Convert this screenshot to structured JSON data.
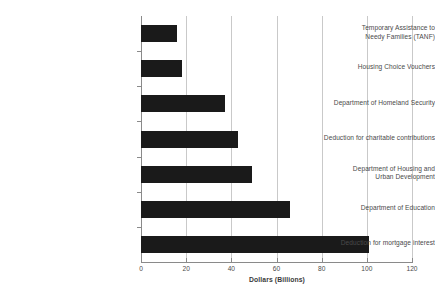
{
  "chart_data": {
    "type": "bar",
    "orientation": "horizontal",
    "title": "",
    "xlabel": "Dollars (Billions)",
    "ylabel": "",
    "xlim": [
      0,
      120
    ],
    "xticks": [
      0,
      20,
      40,
      60,
      80,
      100,
      120
    ],
    "xtick_labels": [
      "0",
      "20",
      "40",
      "60",
      "80",
      "100",
      "120"
    ],
    "grid": "vertical",
    "legend": "none",
    "bar_color": "#1a1a1a",
    "gridline_color": "#c9c9c9",
    "axis_color": "#8a8a8a",
    "label_color": "#4a4a4a",
    "categories": [
      "Temporary Assistance to Needy Families (TANF)",
      "Housing Choice Vouchers",
      "Department of Homeland Security",
      "Deduction for charitable contributions",
      "Department of Housing and Urban Development",
      "Department of Education",
      "Deduction for mortgage interest"
    ],
    "category_lines": [
      [
        "Temporary Assistance to",
        "Needy Families (TANF)"
      ],
      [
        "Housing Choice Vouchers"
      ],
      [
        "Department of Homeland Security"
      ],
      [
        "Deduction for charitable contributions"
      ],
      [
        "Department of Housing and",
        "Urban Development"
      ],
      [
        "Department of Education"
      ],
      [
        "Deduction for mortgage interest"
      ]
    ],
    "values": [
      16,
      18,
      37,
      43,
      49,
      66,
      101
    ]
  }
}
